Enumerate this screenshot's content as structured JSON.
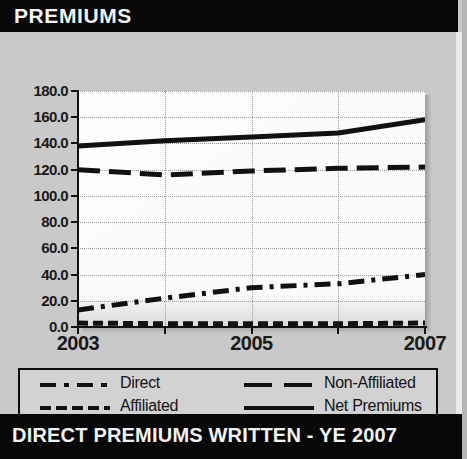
{
  "header": {
    "title": "PREMIUMS"
  },
  "footer": {
    "note": "See Sec. 2, B.3",
    "units": "$ Millions",
    "banner": "DIRECT PREMIUMS WRITTEN - YE 2007"
  },
  "colors": {
    "title_bar_bg": "#080808",
    "title_bar_text": "#f2f2f2",
    "panel_bg": "#c9c9c9",
    "plot_bg": "#fbfbfb",
    "grid": "#9a9a9a",
    "series": "#111111",
    "legend_bg": "#d2d2d2",
    "legend_border": "#0d0d0d"
  },
  "chart_data": {
    "type": "line",
    "title": "PREMIUMS",
    "xlabel": "",
    "ylabel": "",
    "units": "$ Millions",
    "x": [
      2003,
      2004,
      2005,
      2006,
      2007
    ],
    "xtick_labels": [
      "2003",
      "",
      "2005",
      "",
      "2007"
    ],
    "xlim": [
      2003,
      2007
    ],
    "ylim": [
      0.0,
      180.0
    ],
    "ytick_labels": [
      "180.0",
      "160.0",
      "140.0",
      "120.0",
      "100.0",
      "80.0",
      "60.0",
      "40.0",
      "20.0",
      "0.0"
    ],
    "yticks": [
      180.0,
      160.0,
      140.0,
      120.0,
      100.0,
      80.0,
      60.0,
      40.0,
      20.0,
      0.0
    ],
    "grid": true,
    "legend_position": "below-plot",
    "series": [
      {
        "name": "Direct",
        "style": "dash-dot",
        "values": [
          13.0,
          22.0,
          30.0,
          33.0,
          40.0
        ]
      },
      {
        "name": "Non-Affiliated",
        "style": "long-dash",
        "values": [
          120.0,
          116.0,
          119.0,
          121.0,
          122.0
        ]
      },
      {
        "name": "Affiliated",
        "style": "short-dash",
        "values": [
          3.0,
          2.5,
          2.5,
          2.5,
          3.0
        ]
      },
      {
        "name": "Net Premiums",
        "style": "solid",
        "values": [
          138.0,
          142.0,
          145.0,
          148.0,
          158.0
        ]
      }
    ]
  },
  "legend": {
    "items": [
      {
        "label": "Direct",
        "style": "dash-dot"
      },
      {
        "label": "Non-Affiliated",
        "style": "long-dash"
      },
      {
        "label": "Affiliated",
        "style": "short-dash"
      },
      {
        "label": "Net Premiums",
        "style": "solid"
      }
    ]
  }
}
